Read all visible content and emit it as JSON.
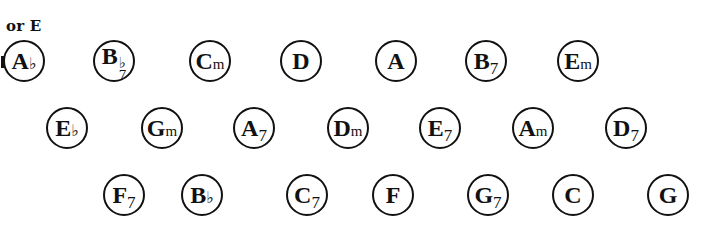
{
  "note": "or E",
  "rows": [
    [
      {
        "root": "A",
        "quality": "♭",
        "type": "flat"
      },
      {
        "root": "B",
        "quality_top": "♭",
        "quality_bottom": "7",
        "type": "stack"
      },
      {
        "root": "C",
        "quality": "m",
        "type": "min"
      },
      {
        "root": "D",
        "quality": "",
        "type": "major"
      },
      {
        "root": "A",
        "quality": "",
        "type": "major"
      },
      {
        "root": "B",
        "quality": "7",
        "type": "sev"
      },
      {
        "root": "E",
        "quality": "m",
        "type": "min"
      }
    ],
    [
      {
        "root": "E",
        "quality": "♭",
        "type": "flat"
      },
      {
        "root": "G",
        "quality": "m",
        "type": "min"
      },
      {
        "root": "A",
        "quality": "7",
        "type": "sev"
      },
      {
        "root": "D",
        "quality": "m",
        "type": "min"
      },
      {
        "root": "E",
        "quality": "7",
        "type": "sev"
      },
      {
        "root": "A",
        "quality": "m",
        "type": "min"
      },
      {
        "root": "D",
        "quality": "7",
        "type": "sev"
      }
    ],
    [
      {
        "root": "F",
        "quality": "7",
        "type": "sev"
      },
      {
        "root": "B",
        "quality": "♭",
        "type": "flat"
      },
      {
        "root": "C",
        "quality": "7",
        "type": "sev"
      },
      {
        "root": "F",
        "quality": "",
        "type": "major"
      },
      {
        "root": "G",
        "quality": "7",
        "type": "sev"
      },
      {
        "root": "C",
        "quality": "",
        "type": "major"
      },
      {
        "root": "G",
        "quality": "",
        "type": "major"
      }
    ]
  ]
}
